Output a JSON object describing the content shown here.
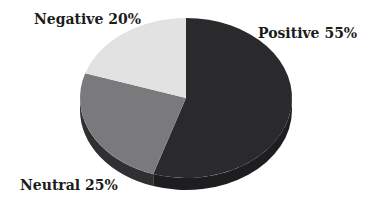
{
  "chart_data": {
    "type": "pie",
    "title": "",
    "style": "3d",
    "categories": [
      "Positive",
      "Neutral",
      "Negative"
    ],
    "values": [
      55,
      25,
      20
    ],
    "labels": [
      "Positive 55%",
      "Neutral 25%",
      "Negative 20%"
    ],
    "colors": [
      "#2a2a2c",
      "#7a7a7c",
      "#e2e2e2"
    ],
    "side_colors": [
      "#1e1e20",
      "#303032",
      "#c8c8c8"
    ],
    "start_angle_deg": -90,
    "direction": "clockwise",
    "legend": "none"
  },
  "layout": {
    "cx": 186,
    "cy": 98,
    "rx": 106,
    "ry": 80,
    "depth": 12,
    "label_positions": [
      {
        "x": 258,
        "y": 38,
        "anchor": "start"
      },
      {
        "x": 20,
        "y": 190,
        "anchor": "start"
      },
      {
        "x": 34,
        "y": 24,
        "anchor": "start"
      }
    ]
  }
}
